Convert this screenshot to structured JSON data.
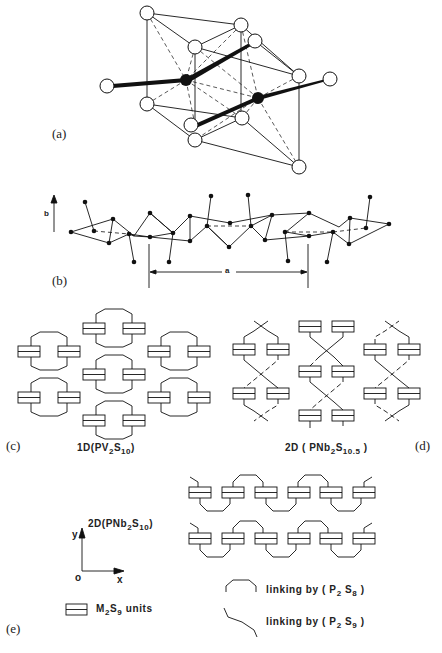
{
  "figure": {
    "panels": [
      {
        "id": "a",
        "label": "(a)",
        "description": "Coordination polyhedra with two filled metal atoms bridged by bonds to open sulfur atoms"
      },
      {
        "id": "b",
        "label": "(b)",
        "axis_label": "b",
        "dimension_label": "a",
        "description": "Zig-zag chain of atoms along a with period a"
      },
      {
        "id": "c",
        "label": "(c)",
        "caption_prefix": "1D",
        "caption_formula": "PV",
        "caption_sub1": "2",
        "caption_mid": "S",
        "caption_sub2": "10"
      },
      {
        "id": "d",
        "label": "(d)",
        "caption_prefix": "2D",
        "caption_formula": "PNb",
        "caption_sub1": "2",
        "caption_mid": "S",
        "caption_sub2": "10.5"
      },
      {
        "id": "e",
        "label": "(e)",
        "caption_prefix": "2D",
        "caption_formula": "PNb",
        "caption_sub1": "2",
        "caption_mid": "S",
        "caption_sub2": "10",
        "axes": {
          "origin": "o",
          "x": "x",
          "y": "y"
        }
      }
    ],
    "legend": {
      "unit": {
        "text_pre": "M",
        "sub1": "2",
        "text_mid": "S",
        "sub2": "9",
        "text_post": " units"
      },
      "link1": {
        "text_pre": "linking by ( P",
        "sub1": "2",
        "text_mid": " S",
        "sub2": "8",
        "text_post": " )"
      },
      "link2": {
        "text_pre": "linking by ( P",
        "sub1": "2",
        "text_mid": " S",
        "sub2": "9",
        "text_post": " )"
      }
    }
  }
}
